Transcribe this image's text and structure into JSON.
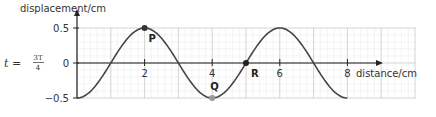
{
  "chart_data": {
    "type": "line",
    "title": "",
    "xlabel": "distance/cm",
    "ylabel": "displacement/cm",
    "xlim": [
      0,
      8
    ],
    "ylim": [
      -0.5,
      0.5
    ],
    "x_ticks": [
      2,
      4,
      6,
      8
    ],
    "x_tick_labels": [
      "2",
      "4",
      "6",
      "8"
    ],
    "y_ticks": [
      0.5,
      0,
      -0.5
    ],
    "y_tick_labels": [
      "0.5",
      "0",
      "−0.5"
    ],
    "grid": true,
    "grid_major_step_x": 1,
    "grid_minor_step_x": 0.2,
    "grid_major_step_y": 0.5,
    "grid_minor_step_y": 0.1,
    "series": [
      {
        "name": "wave",
        "function": "y = -0.5*cos(pi*x/2)",
        "amplitude": 0.5,
        "wavelength": 4,
        "x_range": [
          0,
          8
        ],
        "color": "#444444"
      }
    ],
    "points": [
      {
        "label": "P",
        "x": 2,
        "y": 0.5,
        "color": "#333333"
      },
      {
        "label": "Q",
        "x": 4,
        "y": -0.5,
        "color": "#999999"
      },
      {
        "label": "R",
        "x": 5,
        "y": 0,
        "color": "#222222"
      }
    ],
    "annotation": {
      "prefix": "t =",
      "numerator": "3T",
      "denominator": "4"
    }
  }
}
